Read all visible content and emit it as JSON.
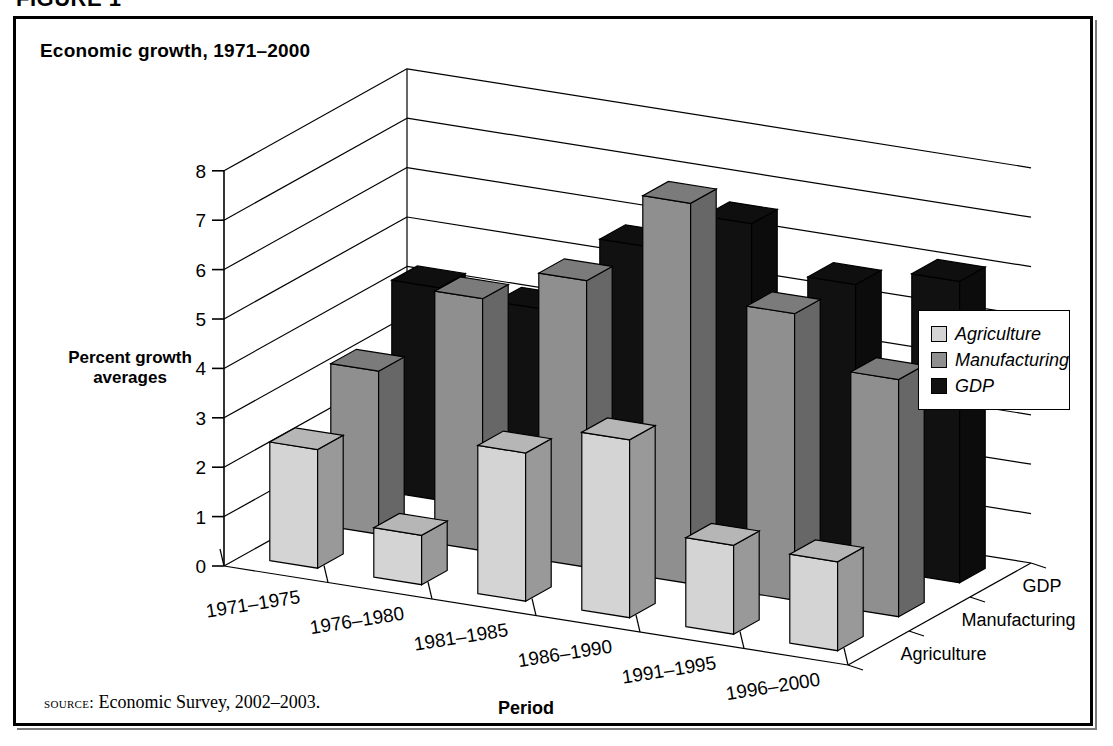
{
  "figure": {
    "caption": "FIGURE 1",
    "title": "Economic growth, 1971–2000",
    "source_label": "source:",
    "source_text": " Economic Survey, 2002–2003."
  },
  "legend": {
    "position": "right",
    "items": [
      {
        "label": "Agriculture",
        "color": "#d4d4d4"
      },
      {
        "label": "Manufacturing",
        "color": "#8f8f8f"
      },
      {
        "label": "GDP",
        "color": "#111111"
      }
    ]
  },
  "axes": {
    "ylabel_line1": "Percent growth",
    "ylabel_line2": "averages",
    "xlabel": "Period",
    "yticks": [
      "8",
      "7",
      "6",
      "5",
      "4",
      "3",
      "2",
      "1",
      "0"
    ],
    "depth_labels": [
      "GDP",
      "Manufacturing",
      "Agriculture"
    ]
  },
  "chart_data": {
    "type": "bar",
    "title": "Economic growth, 1971–2000",
    "subtitle": "",
    "xlabel": "Period",
    "ylabel": "Percent growth averages",
    "zlabel": "",
    "ylim": [
      0,
      8
    ],
    "ytick_step": 1,
    "grid": true,
    "legend_position": "right",
    "projection": "3d",
    "categories": [
      "1971–1975",
      "1976–1980",
      "1981–1985",
      "1986–1990",
      "1991–1995",
      "1996–2000"
    ],
    "series": [
      {
        "name": "Agriculture",
        "color": "#d4d4d4",
        "values": [
          2.4,
          1.0,
          3.0,
          3.6,
          1.8,
          1.8
        ]
      },
      {
        "name": "Manufacturing",
        "color": "#8f8f8f",
        "values": [
          3.3,
          5.1,
          5.8,
          7.7,
          5.8,
          4.8
        ]
      },
      {
        "name": "GDP",
        "color": "#111111",
        "values": [
          4.3,
          4.2,
          5.8,
          6.6,
          5.7,
          6.1
        ]
      }
    ],
    "source": "Economic Survey, 2002–2003."
  }
}
